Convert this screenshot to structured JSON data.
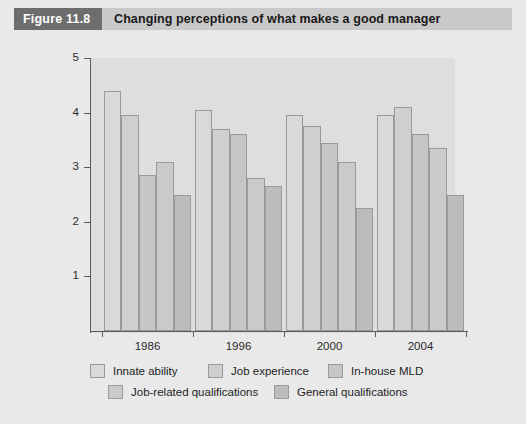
{
  "header": {
    "figure_number": "Figure 11.8",
    "title": "Changing perceptions of what makes a good manager"
  },
  "chart_data": {
    "type": "bar",
    "title": "Changing perceptions of what makes a good manager",
    "xlabel": "",
    "ylabel": "",
    "categories": [
      "1986",
      "1996",
      "2000",
      "2004"
    ],
    "ylim": [
      0,
      5
    ],
    "yticks": [
      1,
      2,
      3,
      4,
      5
    ],
    "ytick_labels": [
      "1",
      "2",
      "3",
      "4",
      "5"
    ],
    "grid": false,
    "legend_position": "bottom",
    "series": [
      {
        "name": "Innate ability",
        "color": "#d9d9d9",
        "values": [
          4.4,
          4.05,
          3.95,
          3.95
        ]
      },
      {
        "name": "Job experience",
        "color": "#cfcfcf",
        "values": [
          3.95,
          3.7,
          3.75,
          4.1
        ]
      },
      {
        "name": "In-house MLD",
        "color": "#c6c6c6",
        "values": [
          2.85,
          3.6,
          3.45,
          3.6
        ]
      },
      {
        "name": "Job-related qualifications",
        "color": "#cbcbcb",
        "values": [
          3.1,
          2.8,
          3.1,
          3.35
        ]
      },
      {
        "name": "General qualifications",
        "color": "#bcbcbc",
        "values": [
          2.5,
          2.65,
          2.25,
          2.5
        ]
      }
    ]
  },
  "colors": {
    "figure_number_bg": "#6d6d6d",
    "title_bg": "#c9c9c9",
    "page_bg": "#e9e9e9",
    "plot_bg": "#dedede",
    "axis": "#5c5c5c",
    "bar_outline": "#9a9a9a"
  }
}
